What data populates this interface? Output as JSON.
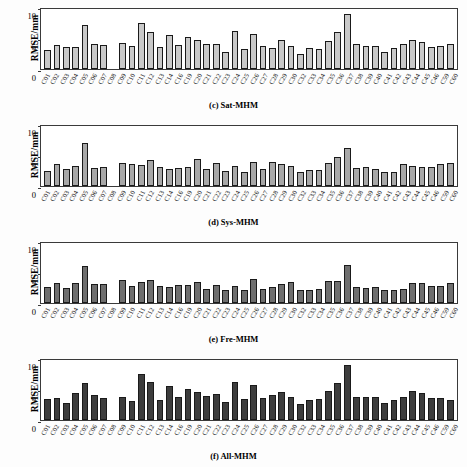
{
  "figure": {
    "ylabel": "RMSE/mm",
    "yticks": [
      "0",
      "5",
      "10"
    ],
    "ylim": [
      0,
      10
    ],
    "categories": [
      "C01",
      "C02",
      "C03",
      "C04",
      "C05",
      "C06",
      "C07",
      "C08",
      "C09",
      "C10",
      "C11",
      "C12",
      "C13",
      "C14",
      "C16",
      "C19",
      "C20",
      "C21",
      "C22",
      "C23",
      "C24",
      "C25",
      "C26",
      "C27",
      "C28",
      "C29",
      "C30",
      "C32",
      "C33",
      "C34",
      "C35",
      "C36",
      "C37",
      "C38",
      "C39",
      "C40",
      "C41",
      "C42",
      "C43",
      "C44",
      "C45",
      "C46",
      "C59",
      "C60"
    ]
  },
  "chart_data": [
    {
      "type": "bar",
      "panel_id": "c",
      "title": "(c) Sat-MHM",
      "xlabel": "",
      "ylabel": "RMSE/mm",
      "ylim": [
        0,
        10
      ],
      "yticks": [
        0,
        5,
        10
      ],
      "grid": false,
      "bar_color": "#c9c9c9",
      "edge_color": "#1a1a1a",
      "categories": [
        "C01",
        "C02",
        "C03",
        "C04",
        "C05",
        "C06",
        "C07",
        "C08",
        "C09",
        "C10",
        "C11",
        "C12",
        "C13",
        "C14",
        "C16",
        "C19",
        "C20",
        "C21",
        "C22",
        "C23",
        "C24",
        "C25",
        "C26",
        "C27",
        "C28",
        "C29",
        "C30",
        "C32",
        "C33",
        "C34",
        "C35",
        "C36",
        "C37",
        "C38",
        "C39",
        "C40",
        "C41",
        "C42",
        "C43",
        "C44",
        "C45",
        "C46",
        "C59",
        "C60"
      ],
      "values": [
        3.1,
        4.0,
        3.7,
        3.6,
        7.4,
        4.2,
        4.0,
        0.0,
        4.3,
        3.9,
        7.6,
        6.1,
        3.7,
        5.6,
        4.0,
        5.3,
        4.9,
        4.2,
        4.1,
        2.9,
        6.4,
        3.4,
        5.8,
        3.9,
        3.5,
        4.8,
        3.9,
        2.5,
        3.5,
        3.4,
        4.6,
        6.2,
        9.1,
        4.2,
        3.9,
        3.9,
        2.8,
        3.5,
        4.1,
        4.9,
        4.5,
        3.7,
        3.8,
        4.1
      ]
    },
    {
      "type": "bar",
      "panel_id": "d",
      "title": "(d) Sys-MHM",
      "xlabel": "",
      "ylabel": "RMSE/mm",
      "ylim": [
        0,
        10
      ],
      "yticks": [
        0,
        5,
        10
      ],
      "grid": false,
      "bar_color": "#a8a8a8",
      "edge_color": "#1a1a1a",
      "categories": [
        "C01",
        "C02",
        "C03",
        "C04",
        "C05",
        "C06",
        "C07",
        "C08",
        "C09",
        "C10",
        "C11",
        "C12",
        "C13",
        "C14",
        "C16",
        "C19",
        "C20",
        "C21",
        "C22",
        "C23",
        "C24",
        "C25",
        "C26",
        "C27",
        "C28",
        "C29",
        "C30",
        "C32",
        "C33",
        "C34",
        "C35",
        "C36",
        "C37",
        "C38",
        "C39",
        "C40",
        "C41",
        "C42",
        "C43",
        "C44",
        "C45",
        "C46",
        "C59",
        "C60"
      ],
      "values": [
        2.5,
        3.6,
        2.8,
        3.3,
        7.2,
        3.0,
        3.2,
        0.0,
        3.9,
        3.6,
        3.5,
        4.4,
        3.1,
        2.8,
        3.0,
        3.1,
        4.5,
        2.9,
        3.8,
        2.5,
        3.3,
        2.4,
        4.0,
        2.8,
        4.0,
        3.6,
        3.4,
        2.4,
        2.7,
        2.6,
        3.8,
        4.8,
        6.3,
        3.0,
        3.2,
        2.9,
        2.4,
        2.4,
        3.6,
        3.3,
        3.2,
        3.1,
        3.7,
        3.8
      ]
    },
    {
      "type": "bar",
      "panel_id": "e",
      "title": "(e) Fre-MHM",
      "xlabel": "",
      "ylabel": "RMSE/mm",
      "ylim": [
        0,
        10
      ],
      "yticks": [
        0,
        5,
        10
      ],
      "grid": false,
      "bar_color": "#6e6e6e",
      "edge_color": "#1a1a1a",
      "categories": [
        "C01",
        "C02",
        "C03",
        "C04",
        "C05",
        "C06",
        "C07",
        "C08",
        "C09",
        "C10",
        "C11",
        "C12",
        "C13",
        "C14",
        "C16",
        "C19",
        "C20",
        "C21",
        "C22",
        "C23",
        "C24",
        "C25",
        "C26",
        "C27",
        "C28",
        "C29",
        "C30",
        "C32",
        "C33",
        "C34",
        "C35",
        "C36",
        "C37",
        "C38",
        "C39",
        "C40",
        "C41",
        "C42",
        "C43",
        "C44",
        "C45",
        "C46",
        "C59",
        "C60"
      ],
      "values": [
        2.6,
        3.4,
        2.5,
        3.4,
        6.1,
        3.2,
        3.1,
        0.0,
        3.8,
        2.9,
        3.5,
        3.9,
        2.8,
        2.6,
        3.0,
        3.0,
        3.5,
        2.4,
        3.0,
        2.1,
        2.8,
        2.2,
        4.0,
        2.4,
        2.6,
        3.2,
        3.5,
        2.1,
        2.2,
        2.3,
        3.7,
        3.7,
        6.4,
        2.6,
        2.5,
        2.6,
        2.1,
        2.1,
        2.4,
        3.4,
        3.4,
        2.9,
        2.8,
        3.4
      ]
    },
    {
      "type": "bar",
      "panel_id": "f",
      "title": "(f) All-MHM",
      "xlabel": "",
      "ylabel": "RMSE/mm",
      "ylim": [
        0,
        10
      ],
      "yticks": [
        0,
        5,
        10
      ],
      "grid": false,
      "bar_color": "#3d3d3d",
      "edge_color": "#1a1a1a",
      "categories": [
        "C01",
        "C02",
        "C03",
        "C04",
        "C05",
        "C06",
        "C07",
        "C08",
        "C09",
        "C10",
        "C11",
        "C12",
        "C13",
        "C14",
        "C16",
        "C19",
        "C20",
        "C21",
        "C22",
        "C23",
        "C24",
        "C25",
        "C26",
        "C27",
        "C28",
        "C29",
        "C30",
        "C32",
        "C33",
        "C34",
        "C35",
        "C36",
        "C37",
        "C38",
        "C39",
        "C40",
        "C41",
        "C42",
        "C43",
        "C44",
        "C45",
        "C46",
        "C59",
        "C60"
      ],
      "values": [
        3.5,
        3.7,
        2.9,
        4.5,
        6.1,
        4.2,
        3.7,
        0.0,
        3.9,
        3.2,
        7.6,
        6.3,
        3.4,
        5.6,
        3.8,
        5.2,
        4.6,
        4.0,
        4.3,
        3.0,
        6.4,
        3.5,
        5.9,
        3.6,
        4.2,
        4.7,
        3.9,
        2.6,
        3.3,
        3.5,
        4.9,
        6.2,
        9.1,
        3.8,
        3.9,
        3.9,
        2.9,
        3.3,
        3.9,
        4.9,
        4.5,
        3.7,
        3.6,
        3.4
      ]
    }
  ]
}
